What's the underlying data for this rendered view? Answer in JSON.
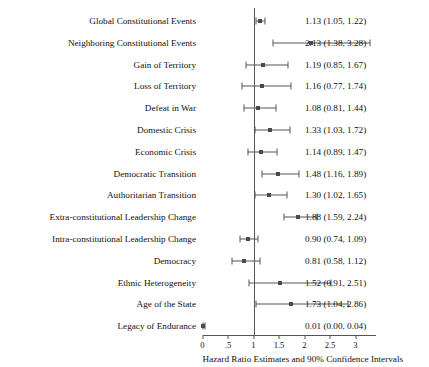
{
  "chart_data": {
    "type": "scatter",
    "title": "",
    "xlabel": "Hazard Ratio Estimates and 90% Confidence Intervals",
    "ylabel": "",
    "xlim": [
      0,
      3.4
    ],
    "grid": false,
    "legend": null,
    "reference_line": 1,
    "tick_labels": [
      "0",
      ".5",
      "1",
      "1.5",
      "2",
      "2.5",
      "3"
    ],
    "tick_values": [
      0,
      0.5,
      1,
      1.5,
      2,
      2.5,
      3
    ],
    "categories": [
      "Global Constitutional Events",
      "Neighboring Constitutional Events",
      "Gain of Territory",
      "Loss of Territory",
      "Defeat in War",
      "Domestic Crisis",
      "Economic Crisis",
      "Democratic Transition",
      "Authoritarian Transition",
      "Extra-constitutional Leadership Change",
      "Intra-constitutional Leadership Change",
      "Democracy",
      "Ethnic Heterogeneity",
      "Age of the State",
      "Legacy of Endurance"
    ],
    "values": [
      1.13,
      2.13,
      1.19,
      1.16,
      1.08,
      1.33,
      1.14,
      1.48,
      1.3,
      1.88,
      0.9,
      0.81,
      1.52,
      1.73,
      0.01
    ],
    "ci_low": [
      1.05,
      1.38,
      0.85,
      0.77,
      0.81,
      1.03,
      0.89,
      1.16,
      1.02,
      1.59,
      0.74,
      0.58,
      0.91,
      1.04,
      0.0
    ],
    "ci_high": [
      1.22,
      3.28,
      1.67,
      1.74,
      1.44,
      1.72,
      1.47,
      1.89,
      1.65,
      2.24,
      1.09,
      1.12,
      2.51,
      2.86,
      0.04
    ],
    "value_labels": [
      "1.13 (1.05, 1.22)",
      "2.13 (1.38, 3.28)",
      "1.19 (0.85, 1.67)",
      "1.16 (0.77, 1.74)",
      "1.08 (0.81, 1.44)",
      "1.33 (1.03, 1.72)",
      "1.14 (0.89, 1.47)",
      "1.48 (1.16, 1.89)",
      "1.30 (1.02, 1.65)",
      "1.88 (1.59, 2.24)",
      "0.90 (0.74, 1.09)",
      "0.81 (0.58, 1.12)",
      "1.52 (0.91, 2.51)",
      "1.73 (1.04, 2.86)",
      "0.01 (0.00, 0.04)"
    ]
  },
  "colors": {
    "marker": "#4a4a4a",
    "line": "#555555",
    "text": "#111111",
    "background": "#ffffff"
  }
}
